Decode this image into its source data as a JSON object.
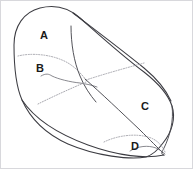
{
  "diagram": {
    "type": "line-drawing",
    "background_color": "#ffffff",
    "outline_color": "#3c3c42",
    "dotted_line_color": "#9a9aa2",
    "label_color": "#1a1a1a",
    "frame_color": "#d8d8dc",
    "width": 193,
    "height": 169,
    "labels": [
      {
        "text": "A",
        "x": 44,
        "y": 36
      },
      {
        "text": "B",
        "x": 40,
        "y": 69
      },
      {
        "text": "C",
        "x": 145,
        "y": 107
      },
      {
        "text": "D",
        "x": 135,
        "y": 147
      }
    ],
    "regions": [
      {
        "id": "A",
        "name": "region-a",
        "description": "upper left lobe"
      },
      {
        "id": "B",
        "name": "region-b",
        "description": "mid left lobe"
      },
      {
        "id": "C",
        "name": "region-c",
        "description": "large right lobe"
      },
      {
        "id": "D",
        "name": "region-d",
        "description": "lower right sliver"
      }
    ],
    "paths": {
      "outer_outline": "M 14 45 C 14 26, 24 12, 40 8 C 56 4, 70 9, 80 18 C 96 32, 120 54, 144 72 C 158 83, 168 94, 172 106 C 176 118, 172 132, 163 143 C 158 150, 152 155, 146 157 C 130 160, 96 156, 68 144 C 46 134, 30 118, 22 100 C 15 84, 14 62, 14 45 Z",
      "top_ridge": "M 73 13 C 90 26, 118 47, 144 68 C 156 78, 166 90, 171 101",
      "a_b_divider_dotted": "M 18 56 C 30 53, 48 54, 62 60 C 72 64, 80 72, 86 80",
      "vertical_divider": "M 71 26 C 71 44, 74 62, 80 76 C 84 86, 90 95, 96 102",
      "b_squiggle": "M 41 76 C 46 73, 49 74, 52 76 C 58 79, 70 82, 80 83 C 86 84, 92 85, 97 87",
      "diagonal_main": "M 85 79 C 100 92, 122 113, 140 130 C 150 140, 158 148, 163 153",
      "dotted_fan_upper": "M 86 80 C 104 74, 126 68, 144 63",
      "dotted_fan_lower": "M 86 82 C 72 88, 54 96, 38 104",
      "bottom_edge": "M 22 100 C 34 118, 58 134, 88 145 C 118 156, 146 159, 164 155",
      "d_dotted_arc": "M 104 142 C 116 136, 134 133, 148 137 C 156 139, 162 145, 165 152",
      "d_inner_curl": "M 130 151 C 138 146, 148 145, 156 148 C 160 150, 163 152, 165 154",
      "right_tip_inner": "M 172 106 C 174 120, 170 136, 164 148 C 162 152, 160 154, 164 155"
    }
  }
}
